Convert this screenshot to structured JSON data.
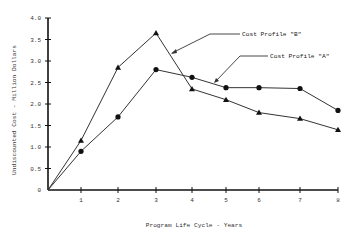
{
  "chart_data": {
    "type": "line",
    "title": "",
    "xlabel": "Program Life Cycle - Years",
    "ylabel": "Undiscounted Cost - Million Dollars",
    "x": [
      1,
      2,
      3,
      4,
      5,
      6,
      7,
      8
    ],
    "x_ticks": [
      "1",
      "2",
      "3",
      "4",
      "5",
      "6",
      "7",
      "8"
    ],
    "y_ticks": [
      "0",
      "0.5",
      "1.0",
      "1.5",
      "2.0",
      "2.5",
      "3.0",
      "3.5",
      "4.0"
    ],
    "xlim": [
      0,
      8
    ],
    "ylim": [
      0,
      4.0
    ],
    "grid": false,
    "legend_position": "annotations",
    "series": [
      {
        "name": "Cost Profile \"A\"",
        "marker": "circle",
        "values": [
          0.9,
          1.7,
          2.8,
          2.62,
          2.38,
          2.38,
          2.36,
          1.85
        ]
      },
      {
        "name": "Cost Profile \"B\"",
        "marker": "triangle",
        "values": [
          1.15,
          2.85,
          3.65,
          2.35,
          2.1,
          1.8,
          1.66,
          1.4
        ]
      }
    ],
    "annotations": [
      {
        "text": "Cost Profile \"B\"",
        "points_to": "series B between year 3 and 4"
      },
      {
        "text": "Cost Profile \"A\"",
        "points_to": "series A between year 4 and 5"
      }
    ]
  }
}
